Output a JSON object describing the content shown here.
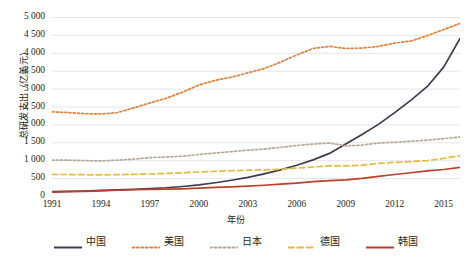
{
  "chart_data": {
    "type": "line",
    "title": "",
    "xlabel": "年份",
    "ylabel": "总研发支出（亿美元）",
    "xlim": [
      1991,
      2016
    ],
    "ylim": [
      0,
      5000
    ],
    "ytick_step": 500,
    "grid": true,
    "legend_position": "bottom",
    "x": [
      1991,
      1992,
      1993,
      1994,
      1995,
      1996,
      1997,
      1998,
      1999,
      2000,
      2001,
      2002,
      2003,
      2004,
      2005,
      2006,
      2007,
      2008,
      2009,
      2010,
      2011,
      2012,
      2013,
      2014,
      2015,
      2016
    ],
    "xtick_labels": [
      "1991",
      "1994",
      "1997",
      "2000",
      "2003",
      "2006",
      "2009",
      "2012",
      "2015"
    ],
    "ytick_labels": [
      "0",
      "500",
      "1 000",
      "1 500",
      "2 000",
      "2 500",
      "3 000",
      "3 500",
      "4 000",
      "4 500",
      "5 000"
    ],
    "series": [
      {
        "name": "中国",
        "color": "#3f3b4e",
        "style": "solid",
        "values": [
          120,
          130,
          140,
          155,
          170,
          185,
          205,
          230,
          265,
          310,
          370,
          440,
          520,
          620,
          730,
          860,
          1010,
          1190,
          1450,
          1720,
          2000,
          2330,
          2680,
          3060,
          3600,
          4400
        ]
      },
      {
        "name": "美国",
        "color": "#e08240",
        "style": "dotted",
        "values": [
          2350,
          2330,
          2300,
          2290,
          2330,
          2460,
          2600,
          2730,
          2900,
          3100,
          3230,
          3320,
          3440,
          3560,
          3740,
          3940,
          4120,
          4180,
          4120,
          4130,
          4180,
          4270,
          4330,
          4480,
          4650,
          4820
        ]
      },
      {
        "name": "日本",
        "color": "#b5a99a",
        "style": "dotted",
        "values": [
          1000,
          1000,
          990,
          980,
          1000,
          1030,
          1070,
          1090,
          1110,
          1160,
          1200,
          1240,
          1280,
          1310,
          1360,
          1410,
          1450,
          1480,
          1400,
          1420,
          1480,
          1500,
          1530,
          1560,
          1600,
          1650
        ]
      },
      {
        "name": "德国",
        "color": "#e8b93c",
        "style": "dashed",
        "values": [
          600,
          600,
          595,
          590,
          595,
          605,
          615,
          630,
          650,
          670,
          690,
          705,
          720,
          730,
          745,
          780,
          810,
          840,
          840,
          860,
          910,
          940,
          960,
          990,
          1050,
          1130
        ]
      },
      {
        "name": "韩国",
        "color": "#bf3f28",
        "style": "solid",
        "values": [
          110,
          120,
          130,
          145,
          160,
          175,
          185,
          190,
          200,
          220,
          240,
          255,
          275,
          300,
          330,
          360,
          400,
          430,
          450,
          490,
          550,
          600,
          650,
          700,
          740,
          800
        ]
      }
    ]
  },
  "axis": {
    "y_title": "总研发支出（亿美元）",
    "x_title": "年份"
  }
}
